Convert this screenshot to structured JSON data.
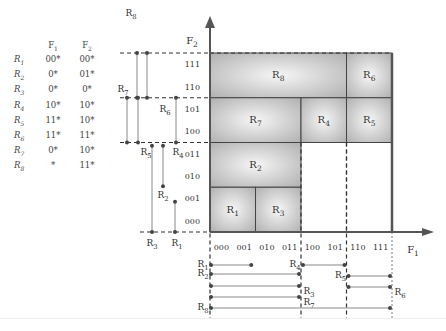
{
  "table": {
    "headers": [
      "",
      "F1",
      "F2"
    ],
    "rows": [
      {
        "rule": "R1",
        "f1": "00*",
        "f2": "00*"
      },
      {
        "rule": "R2",
        "f1": "0*",
        "f2": "01*"
      },
      {
        "rule": "R3",
        "f1": "0*",
        "f2": "0*"
      },
      {
        "rule": "R4",
        "f1": "10*",
        "f2": "10*"
      },
      {
        "rule": "R5",
        "f1": "11*",
        "f2": "10*"
      },
      {
        "rule": "R6",
        "f1": "11*",
        "f2": "11*"
      },
      {
        "rule": "R7",
        "f1": "0*",
        "f2": "10*"
      },
      {
        "rule": "R8",
        "f1": "*",
        "f2": "11*"
      }
    ]
  },
  "axes": {
    "x_label": "F1",
    "y_label": "F2",
    "x_ticks": [
      "000",
      "001",
      "010",
      "011",
      "100",
      "101",
      "110",
      "111"
    ],
    "y_ticks": [
      "000",
      "001",
      "010",
      "011",
      "100",
      "101",
      "110",
      "111"
    ]
  },
  "regions": [
    {
      "label": "R8",
      "x0": 0,
      "x1": 6,
      "y0": 6,
      "y1": 8
    },
    {
      "label": "R6",
      "x0": 6,
      "x1": 8,
      "y0": 6,
      "y1": 8
    },
    {
      "label": "R7",
      "x0": 0,
      "x1": 4,
      "y0": 4,
      "y1": 6
    },
    {
      "label": "R4",
      "x0": 4,
      "x1": 6,
      "y0": 4,
      "y1": 6
    },
    {
      "label": "R5",
      "x0": 6,
      "x1": 8,
      "y0": 4,
      "y1": 6
    },
    {
      "label": "R2",
      "x0": 0,
      "x1": 4,
      "y0": 2,
      "y1": 4
    },
    {
      "label": "R1",
      "x0": 0,
      "x1": 2,
      "y0": 0,
      "y1": 2
    },
    {
      "label": "R3",
      "x0": 2,
      "x1": 4,
      "y0": 0,
      "y1": 2
    }
  ],
  "f2_ranges": [
    {
      "label": "R8",
      "lo": 6,
      "hi": 8,
      "x": 137,
      "label_pos": "top"
    },
    {
      "label": "R8b",
      "lo": 6,
      "hi": 8,
      "x": 147,
      "label_pos": "none"
    },
    {
      "label": "R7",
      "lo": 4,
      "hi": 6,
      "x": 127,
      "label_pos": "top-left"
    },
    {
      "label": "R5",
      "lo": 4,
      "hi": 6,
      "x": 138,
      "label_pos": "bottom"
    },
    {
      "label": "R6",
      "lo": 4,
      "hi": 6,
      "x": 178,
      "label_pos": "top-left-in"
    },
    {
      "label": "R4",
      "lo": 4,
      "hi": 6,
      "x": 166,
      "label_pos": "bottom-right"
    },
    {
      "label": "R3",
      "lo": 0,
      "hi": 4,
      "x": 152,
      "label_pos": "bottom"
    },
    {
      "label": "R2",
      "lo": 2,
      "hi": 4,
      "x": 163,
      "label_pos": "bottom"
    },
    {
      "label": "R1",
      "lo": 0,
      "hi": 1,
      "x": 175,
      "label_pos": "bottom"
    }
  ],
  "f1_ranges": [
    {
      "label": "R1",
      "lo": 0,
      "hi": 1.9,
      "y": 265,
      "label_side": "left"
    },
    {
      "label": "R4",
      "lo": 4,
      "hi": 6,
      "y": 265,
      "label_side": "left"
    },
    {
      "label": "R2",
      "lo": 0,
      "hi": 4,
      "y": 274,
      "label_side": "left"
    },
    {
      "label": "R3",
      "lo": 0,
      "hi": 4,
      "y": 286,
      "label_side": "right"
    },
    {
      "label": "R5",
      "lo": 6,
      "hi": 8,
      "y": 276,
      "label_side": "left"
    },
    {
      "label": "R6",
      "lo": 6,
      "hi": 8,
      "y": 287,
      "label_side": "right"
    },
    {
      "label": "R7",
      "lo": 0,
      "hi": 4,
      "y": 297,
      "label_side": "right"
    },
    {
      "label": "R8",
      "lo": 0,
      "hi": 8,
      "y": 308,
      "label_side": "left"
    }
  ],
  "colors": {
    "region_fill_center": "#f4f4f4",
    "region_fill_edge": "#b8b8b8",
    "axis": "#555555",
    "dashed": "#333333",
    "range_line": "#888888"
  }
}
